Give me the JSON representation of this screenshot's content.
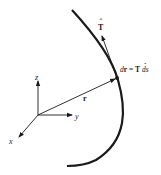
{
  "diagram": {
    "colors": {
      "ink": "#1a1a1a",
      "background": "#ffffff"
    },
    "axes": {
      "z_label": "z",
      "y_label": "y",
      "x_label": "x"
    },
    "position_vector_label": "r",
    "tangent_label": "T",
    "tangent_hat": "ˆ",
    "equation": {
      "lhs_d": "d",
      "lhs_r": "r",
      "equals": " = ",
      "rhs_T": "T",
      "rhs_ds": " ds"
    }
  }
}
